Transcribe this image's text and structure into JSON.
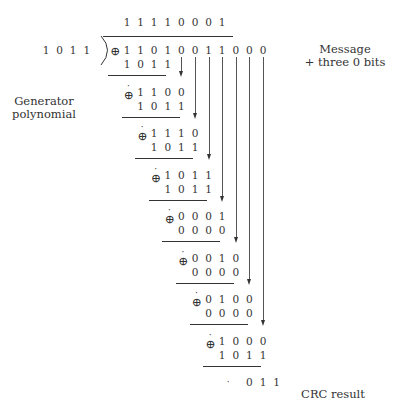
{
  "quotient": [
    "1",
    "1",
    "1",
    "1",
    "0",
    "0",
    "0",
    "1"
  ],
  "divisor": [
    "1",
    "0",
    "1",
    "1"
  ],
  "dividend": [
    "1",
    "1",
    "0",
    "1",
    "0",
    "0",
    "1",
    "1",
    "0",
    "0",
    "0"
  ],
  "labels": {
    "generator": "Generator polynomial",
    "generator_line1": "Generator",
    "generator_line2": "polynomial",
    "message_line1": "Message",
    "message_line2": "+ three 0 bits",
    "crc": "CRC result"
  },
  "steps": [
    {
      "top": [
        "1",
        "1",
        "0",
        "1"
      ],
      "sub": [
        "1",
        "0",
        "1",
        "1"
      ]
    },
    {
      "top": [
        "1",
        "1",
        "0",
        "0"
      ],
      "sub": [
        "1",
        "0",
        "1",
        "1"
      ]
    },
    {
      "top": [
        "1",
        "1",
        "1",
        "0"
      ],
      "sub": [
        "1",
        "0",
        "1",
        "1"
      ]
    },
    {
      "top": [
        "1",
        "0",
        "1",
        "1"
      ],
      "sub": [
        "1",
        "0",
        "1",
        "1"
      ]
    },
    {
      "top": [
        "0",
        "0",
        "0",
        "1"
      ],
      "sub": [
        "0",
        "0",
        "0",
        "0"
      ]
    },
    {
      "top": [
        "0",
        "0",
        "1",
        "0"
      ],
      "sub": [
        "0",
        "0",
        "0",
        "0"
      ]
    },
    {
      "top": [
        "0",
        "1",
        "0",
        "0"
      ],
      "sub": [
        "0",
        "0",
        "0",
        "0"
      ]
    },
    {
      "top": [
        "1",
        "0",
        "0",
        "0"
      ],
      "sub": [
        "1",
        "0",
        "1",
        "1"
      ]
    }
  ],
  "remainder": [
    "0",
    "1",
    "1"
  ],
  "symbols": {
    "xor": "⊕",
    "dot": "·"
  }
}
